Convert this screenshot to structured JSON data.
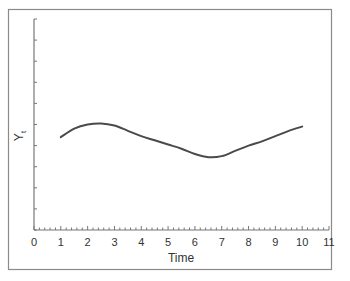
{
  "chart_data": {
    "type": "line",
    "title": "",
    "xlabel": "Time",
    "ylabel": "Yt",
    "ylabel_main": "Y",
    "ylabel_sub": "t",
    "xlim": [
      0,
      11
    ],
    "ylim": [
      0,
      10
    ],
    "x_ticks": [
      "0",
      "1",
      "2",
      "3",
      "4",
      "5",
      "6",
      "7",
      "8",
      "9",
      "10",
      "11"
    ],
    "y_ticks_labeled": false,
    "grid": false,
    "legend": null,
    "series": [
      {
        "name": "Yt",
        "color": "#4a4a4a",
        "x": [
          1,
          1.5,
          2,
          2.5,
          3,
          3.5,
          4,
          4.5,
          5,
          5.5,
          6,
          6.5,
          7,
          7.5,
          8,
          8.5,
          9,
          9.5,
          10
        ],
        "y": [
          4.4,
          4.8,
          5.0,
          5.05,
          4.95,
          4.7,
          4.45,
          4.25,
          4.05,
          3.85,
          3.6,
          3.45,
          3.5,
          3.75,
          4.0,
          4.2,
          4.45,
          4.7,
          4.9
        ]
      }
    ]
  },
  "colors": {
    "frame": "#8a8a8a",
    "axis": "#777777",
    "line": "#4a4a4a",
    "text": "#333333"
  }
}
